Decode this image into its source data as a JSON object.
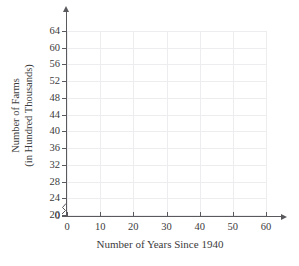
{
  "chart_data": {
    "type": "scatter",
    "title": "",
    "subtitle": "",
    "xlabel": "Number of Years Since 1940",
    "ylabel_line1": "Number of Farms",
    "ylabel_line2": "(in Hundred Thousands)",
    "ylabel": "Number of Farms (in Hundred Thousands)",
    "x": [],
    "values": [],
    "series": [],
    "xticks": [
      0,
      10,
      20,
      30,
      40,
      50,
      60
    ],
    "xtick_labels": [
      "0",
      "10",
      "20",
      "30",
      "40",
      "50",
      "60"
    ],
    "yticks": [
      0,
      20,
      24,
      28,
      32,
      36,
      40,
      44,
      48,
      52,
      56,
      60,
      64
    ],
    "ytick_labels": [
      "0",
      "20",
      "24",
      "28",
      "32",
      "36",
      "40",
      "44",
      "48",
      "52",
      "56",
      "60",
      "64"
    ],
    "xlim": [
      0,
      60
    ],
    "ylim": [
      20,
      64
    ],
    "y_axis_break": true,
    "y_axis_break_note": "axis broken between 0 and 20",
    "grid": true,
    "legend": "none",
    "annotations": [],
    "colors": {
      "grid": "#ededf0",
      "axis": "#59595e",
      "text": "#3b3b3b",
      "background": "#ffffff"
    }
  }
}
